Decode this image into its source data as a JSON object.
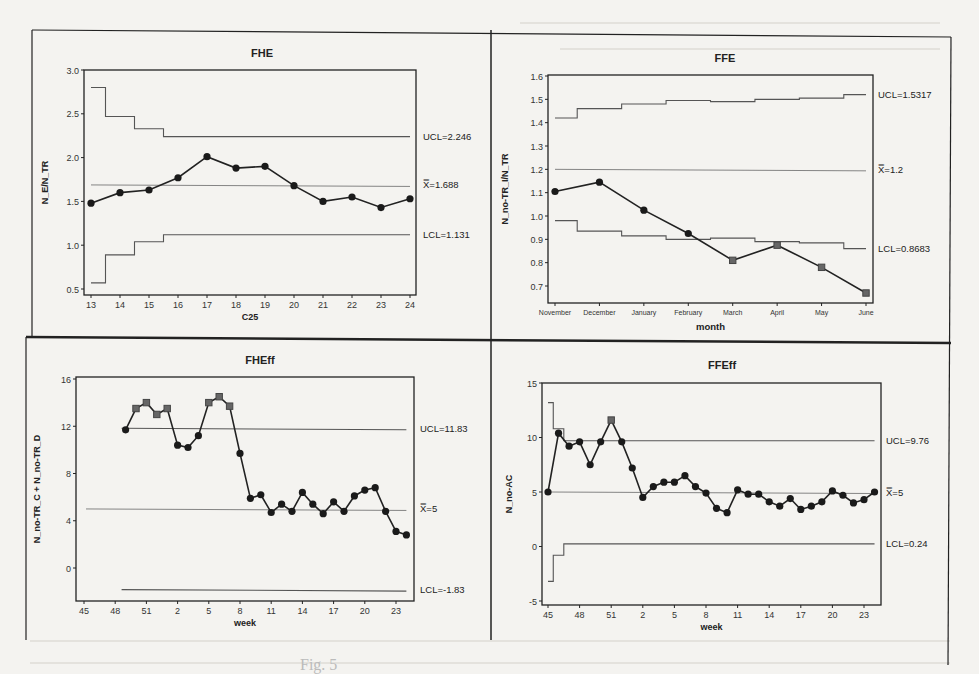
{
  "figure": {
    "caption_fragment": "Fig. 5",
    "panels_layout": "2x2 grid of control charts"
  },
  "chart_data": [
    {
      "id": "fhe",
      "type": "line",
      "title": "FHE",
      "xlabel": "C25",
      "ylabel": "N_E/N_TR",
      "x": [
        13,
        14,
        15,
        16,
        17,
        18,
        19,
        20,
        21,
        22,
        23,
        24
      ],
      "x_ticks": [
        "13",
        "14",
        "15",
        "16",
        "17",
        "18",
        "19",
        "20",
        "21",
        "22",
        "23",
        "24"
      ],
      "values": [
        1.48,
        1.6,
        1.63,
        1.77,
        2.01,
        1.88,
        1.9,
        1.68,
        1.5,
        1.55,
        1.43,
        1.53
      ],
      "ylim": [
        0.5,
        3.0
      ],
      "y_ticks": [
        "0.5",
        "1.0",
        "1.5",
        "2.0",
        "2.5",
        "3.0"
      ],
      "ucl_steps": [
        2.8,
        2.47,
        2.33,
        2.24,
        2.24,
        2.24,
        2.24,
        2.24,
        2.24,
        2.24,
        2.24,
        2.24
      ],
      "lcl_steps": [
        0.57,
        0.89,
        1.04,
        1.12,
        1.12,
        1.12,
        1.12,
        1.12,
        1.12,
        1.12,
        1.12,
        1.12
      ],
      "center": 1.688,
      "labels": {
        "ucl": "UCL=2.246",
        "center": "X̿=1.688",
        "lcl": "LCL=1.131"
      }
    },
    {
      "id": "ffe",
      "type": "line",
      "title": "FFE",
      "xlabel": "month",
      "ylabel": "N_no-TR_I/N_TR",
      "x_ticks": [
        "November",
        "December",
        "January",
        "February",
        "March",
        "April",
        "May",
        "June"
      ],
      "values": [
        1.105,
        1.145,
        1.025,
        0.925,
        0.81,
        0.875,
        0.78,
        0.67
      ],
      "flagged": [
        false,
        false,
        false,
        false,
        true,
        true,
        true,
        true
      ],
      "ylim": [
        0.65,
        1.6
      ],
      "y_ticks": [
        "0.7",
        "0.8",
        "0.9",
        "1.0",
        "1.1",
        "1.2",
        "1.3",
        "1.4",
        "1.5",
        "1.6"
      ],
      "ucl_steps": [
        1.42,
        1.46,
        1.48,
        1.495,
        1.49,
        1.5,
        1.505,
        1.52
      ],
      "lcl_steps": [
        0.98,
        0.935,
        0.915,
        0.9,
        0.905,
        0.89,
        0.885,
        0.86
      ],
      "center": 1.2,
      "labels": {
        "ucl": "UCL=1.5317",
        "center": "X̿=1.2",
        "lcl": "LCL=0.8683"
      }
    },
    {
      "id": "fheff",
      "type": "line",
      "title": "FHEff",
      "xlabel": "week",
      "ylabel": "N_no-TR_C + N_no-TR_D",
      "x_ticks": [
        "45",
        "48",
        "51",
        "2",
        "5",
        "8",
        "11",
        "14",
        "17",
        "20",
        "23"
      ],
      "x_weeks": [
        "49",
        "50",
        "51",
        "52",
        "1",
        "2",
        "3",
        "4",
        "5",
        "6",
        "7",
        "8",
        "9",
        "10",
        "11",
        "12",
        "13",
        "14",
        "15",
        "16",
        "17",
        "18",
        "19",
        "20",
        "21",
        "22",
        "23",
        "24"
      ],
      "start_index": 4,
      "values": [
        11.7,
        13.5,
        14.0,
        13.0,
        13.5,
        10.4,
        10.2,
        11.2,
        14.0,
        14.5,
        13.7,
        9.7,
        5.9,
        6.2,
        4.7,
        5.4,
        4.8,
        6.4,
        5.4,
        4.6,
        5.6,
        4.8,
        6.1,
        6.6,
        6.8,
        4.8,
        3.1,
        2.8
      ],
      "flagged": [
        false,
        true,
        true,
        true,
        true,
        false,
        false,
        false,
        true,
        true,
        true,
        false,
        false,
        false,
        false,
        false,
        false,
        false,
        false,
        false,
        false,
        false,
        false,
        false,
        false,
        false,
        false,
        false
      ],
      "ylim": [
        -3.5,
        16
      ],
      "y_ticks": [
        "0",
        "4",
        "8",
        "12",
        "16"
      ],
      "ucl": 11.83,
      "center": 5,
      "lcl": -1.83,
      "labels": {
        "ucl": "UCL=11.83",
        "center": "X̿=5",
        "lcl": "LCL=-1.83"
      }
    },
    {
      "id": "ffeff",
      "type": "line",
      "title": "FFEff",
      "xlabel": "week",
      "ylabel": "N_no-AC",
      "x_ticks": [
        "45",
        "48",
        "51",
        "2",
        "5",
        "8",
        "11",
        "14",
        "17",
        "20",
        "23"
      ],
      "x_weeks": [
        "45",
        "46",
        "47",
        "48",
        "49",
        "50",
        "51",
        "52",
        "1",
        "2",
        "3",
        "4",
        "5",
        "6",
        "7",
        "8",
        "9",
        "10",
        "11",
        "12",
        "13",
        "14",
        "15",
        "16",
        "17",
        "18",
        "19",
        "20",
        "21",
        "22",
        "23",
        "24"
      ],
      "values": [
        5.0,
        10.4,
        9.2,
        9.6,
        7.5,
        9.6,
        11.6,
        9.6,
        7.2,
        4.5,
        5.5,
        5.9,
        5.9,
        6.5,
        5.5,
        4.9,
        3.5,
        3.1,
        5.2,
        4.8,
        4.8,
        4.1,
        3.7,
        4.4,
        3.4,
        3.7,
        4.1,
        5.1,
        4.7,
        4.0,
        4.3,
        5.0
      ],
      "flagged": [
        false,
        false,
        false,
        false,
        false,
        false,
        true,
        false,
        false,
        false,
        false,
        false,
        false,
        false,
        false,
        false,
        false,
        false,
        false,
        false,
        false,
        false,
        false,
        false,
        false,
        false,
        false,
        false,
        false,
        false,
        false,
        false
      ],
      "ylim": [
        -5,
        15
      ],
      "y_ticks": [
        "-5",
        "0",
        "5",
        "10",
        "15"
      ],
      "ucl_steps": [
        13.2,
        10.8,
        9.7
      ],
      "lcl_steps": [
        -3.2,
        -0.8,
        0.24
      ],
      "ucl": 9.76,
      "center": 5,
      "lcl": 0.24,
      "labels": {
        "ucl": "UCL=9.76",
        "center": "X̿=5",
        "lcl": "LCL=0.24"
      }
    }
  ]
}
